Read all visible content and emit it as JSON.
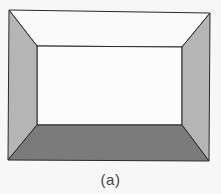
{
  "figure": {
    "caption": "(a)",
    "outer_rect": {
      "tl": [
        9,
        10
      ],
      "tr": [
        210,
        13
      ],
      "br": [
        209,
        161
      ],
      "bl": [
        8,
        160
      ]
    },
    "inner_rect": {
      "tl": [
        37,
        46
      ],
      "tr": [
        182,
        47
      ],
      "br": [
        182,
        125
      ],
      "bl": [
        37,
        125
      ]
    },
    "faces": {
      "ceiling": {
        "label": "ceiling",
        "color": "#fafafa"
      },
      "back_wall": {
        "label": "back wall",
        "color": "#fbfbfb"
      },
      "left_wall": {
        "label": "left wall",
        "color": "#b5b5b5"
      },
      "right_wall": {
        "label": "right wall",
        "color": "#b5b5b5"
      },
      "floor": {
        "label": "floor",
        "color": "#7b7b7b"
      }
    },
    "edge_color": "#2a2a2a"
  }
}
